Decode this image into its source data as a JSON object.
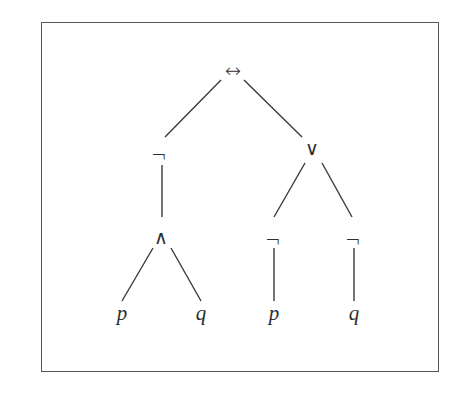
{
  "diagram": {
    "type": "syntax-tree",
    "root": {
      "symbol": "↔",
      "children": [
        {
          "symbol": "¬",
          "children": [
            {
              "symbol": "∧",
              "children": [
                {
                  "symbol": "p"
                },
                {
                  "symbol": "q"
                }
              ]
            }
          ]
        },
        {
          "symbol": "∨",
          "children": [
            {
              "symbol": "¬",
              "children": [
                {
                  "symbol": "p"
                }
              ]
            },
            {
              "symbol": "¬",
              "children": [
                {
                  "symbol": "q"
                }
              ]
            }
          ]
        }
      ]
    },
    "nodes": {
      "iff": "↔",
      "not_left": "¬",
      "or": "∨",
      "and": "∧",
      "not_p": "¬",
      "not_q": "¬",
      "leaf_p1": "p",
      "leaf_q1": "q",
      "leaf_p2": "p",
      "leaf_q2": "q"
    },
    "colors": {
      "line": "#3a3a3a",
      "border": "#555555"
    }
  }
}
